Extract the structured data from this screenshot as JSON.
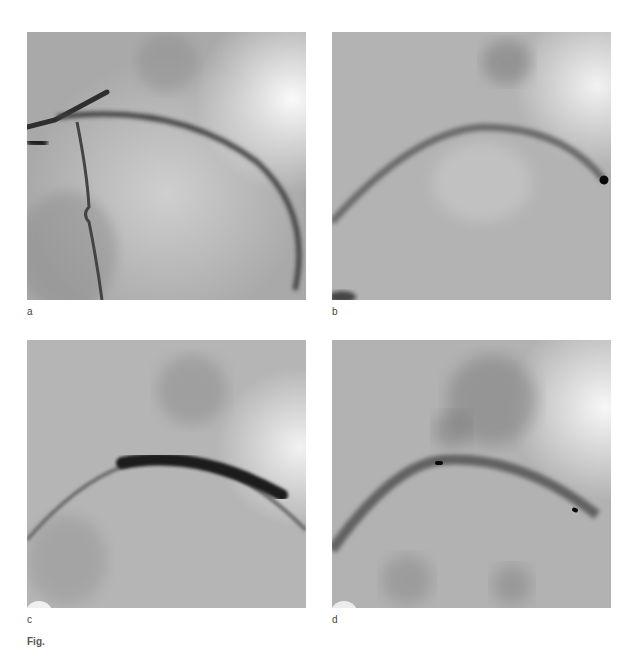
{
  "figure": {
    "panels": [
      {
        "id": "a",
        "label": "a",
        "description": "Coronary angiogram with guiding catheter and contrast-filled curved artery"
      },
      {
        "id": "b",
        "label": "b",
        "description": "Angiogram with guidewire along curved vessel, radiopaque marker at right"
      },
      {
        "id": "c",
        "label": "c",
        "description": "Angiogram with inflated balloon (dark segment) along curved vessel"
      },
      {
        "id": "d",
        "label": "d",
        "description": "Angiogram with stent in place, two radiopaque markers visible"
      }
    ],
    "caption": "Fig."
  },
  "colors": {
    "background": "#ffffff",
    "fluoro_base": "#b8b8b8",
    "vessel_dark": "#3a3a3a",
    "balloon": "#1e1e1e",
    "marker": "#0a0a0a"
  }
}
